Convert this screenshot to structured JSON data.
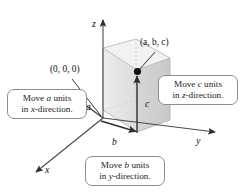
{
  "figure": {
    "kind": "3d-coordinate-plotting-diagram",
    "background": "#ffffff"
  },
  "axes": [
    {
      "name": "z-axis",
      "label": "z",
      "direction": "up"
    },
    {
      "name": "y-axis",
      "label": "y",
      "direction": "right"
    },
    {
      "name": "x-axis",
      "label": "x",
      "direction": "down-left"
    }
  ],
  "points": [
    {
      "name": "point-abc",
      "label": "(a, b, c)",
      "marker": "filled-dot"
    },
    {
      "name": "origin",
      "label": "(0, 0, 0)",
      "marker": "none"
    }
  ],
  "segments": [
    {
      "name": "segment-a",
      "label": "a"
    },
    {
      "name": "segment-b",
      "label": "b"
    },
    {
      "name": "segment-c",
      "label": "c"
    }
  ],
  "callouts": [
    {
      "name": "callout-x",
      "line1_pre": "Move ",
      "line1_var": "a",
      "line1_post": " units",
      "line2_pre": "in ",
      "line2_var": "x",
      "line2_post": "-direction."
    },
    {
      "name": "callout-z",
      "line1_pre": "Move ",
      "line1_var": "c",
      "line1_post": " units",
      "line2_pre": "in ",
      "line2_var": "z",
      "line2_post": "-direction."
    },
    {
      "name": "callout-y",
      "line1_pre": "Move ",
      "line1_var": "b",
      "line1_post": " units",
      "line2_pre": "in ",
      "line2_var": "y",
      "line2_post": "-direction."
    }
  ],
  "colors": {
    "box_left_face": "#e4e4e4",
    "box_right_face": "#d2d2d2",
    "box_top_face": "#efefef",
    "box_floor_face": "#e9e9e9",
    "axis_stroke": "#3a3a3a",
    "edge_stroke": "#9a9a9a",
    "callout_border": "#8d8d8d",
    "text": "#111111"
  }
}
